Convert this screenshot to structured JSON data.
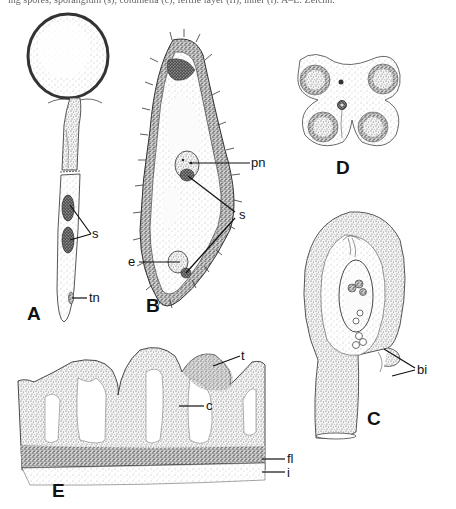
{
  "caption": {
    "text": "ing spores; sporangium (s), columella (c), fertile layer (fl), inner (i). A–E: Zeichn."
  },
  "figure": {
    "panels": [
      {
        "id": "A",
        "label": "A",
        "description": "stalked sporangium with globular head",
        "parts": [
          {
            "label": "s"
          },
          {
            "label": "tn"
          }
        ]
      },
      {
        "id": "B",
        "label": "B",
        "description": "spiny spindle-shaped cell in section",
        "parts": [
          {
            "label": "pn"
          },
          {
            "label": "s"
          },
          {
            "label": "e"
          }
        ]
      },
      {
        "id": "C",
        "label": "C",
        "description": "ovule-like structure with integuments",
        "parts": [
          {
            "label": "bi"
          }
        ]
      },
      {
        "id": "D",
        "label": "D",
        "description": "four-lobed cross section with four sporangial loci",
        "parts": []
      },
      {
        "id": "E",
        "label": "E",
        "description": "section through fruiting surface",
        "parts": [
          {
            "label": "t"
          },
          {
            "label": "c"
          },
          {
            "label": "fl"
          },
          {
            "label": "i"
          }
        ]
      }
    ]
  },
  "labels": {
    "A": "A",
    "B": "B",
    "C": "C",
    "D": "D",
    "E": "E",
    "A_s": "s",
    "A_tn": "tn",
    "B_pn": "pn",
    "B_s": "s",
    "B_e": "e",
    "C_bi": "bi",
    "E_t": "t",
    "E_c": "c",
    "E_fl": "fl",
    "E_i": "i"
  },
  "colors": {
    "ink": "#111111",
    "paper": "#ffffff",
    "stipple": "#555555"
  }
}
